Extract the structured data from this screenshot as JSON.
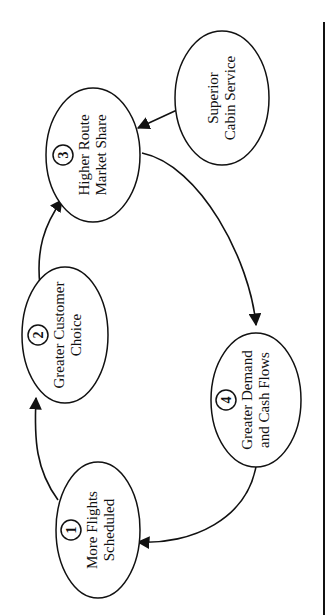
{
  "diagram": {
    "title": "",
    "orientation": "rotated-90-ccw",
    "colors": {
      "stroke": "#111111",
      "background": "#ffffff"
    },
    "nodes": [
      {
        "id": "n1",
        "number": "1",
        "lines": [
          "More Flights",
          "Scheduled"
        ],
        "cx": 98,
        "cy": 530,
        "rx": 42,
        "ry": 68
      },
      {
        "id": "n2",
        "number": "2",
        "lines": [
          "Greater Customer",
          "Choice"
        ],
        "cx": 65,
        "cy": 335,
        "rx": 43,
        "ry": 68
      },
      {
        "id": "n3",
        "number": "3",
        "lines": [
          "Higher Route",
          "Market Share"
        ],
        "cx": 93,
        "cy": 155,
        "rx": 47,
        "ry": 67
      },
      {
        "id": "n4",
        "number": "4",
        "lines": [
          "Greater Demand",
          "and Cash Flows"
        ],
        "cx": 256,
        "cy": 400,
        "rx": 45,
        "ry": 67
      },
      {
        "id": "n5",
        "number": "",
        "lines": [
          "Superior",
          "Cabin Service"
        ],
        "cx": 222,
        "cy": 98,
        "rx": 47,
        "ry": 67
      }
    ],
    "edges": [
      {
        "from": "n1",
        "to": "n2",
        "label": ""
      },
      {
        "from": "n2",
        "to": "n3",
        "label": ""
      },
      {
        "from": "n3",
        "to": "n4",
        "label": ""
      },
      {
        "from": "n4",
        "to": "n1",
        "label": ""
      },
      {
        "from": "n5",
        "to": "n3",
        "label": ""
      }
    ]
  }
}
